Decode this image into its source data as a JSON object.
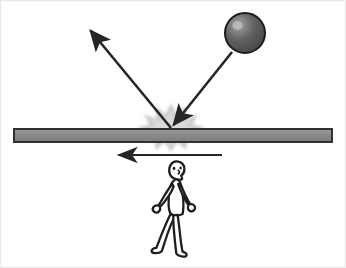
{
  "diagram": {
    "background_color": "#ffffff",
    "frame_border_color": "#e9eaec",
    "width": 346,
    "height": 268,
    "elements": {
      "ball": {
        "label": "ball",
        "shape": "circle",
        "center_x": 245,
        "center_y": 33,
        "radius": 20,
        "fill_color": "#5a5a5a",
        "highlight_color": "#9d9d9d",
        "outline_color": "#1c1c1c",
        "outline_width": 2
      },
      "incoming_arrow": {
        "label": "incoming trajectory",
        "from_x": 232,
        "from_y": 52,
        "to_x": 171,
        "to_y": 128,
        "color": "#262626",
        "stroke_width": 2.6,
        "direction": "down-left"
      },
      "outgoing_arrow": {
        "label": "rebound trajectory",
        "from_x": 171,
        "from_y": 128,
        "to_x": 88,
        "to_y": 28,
        "color": "#262626",
        "stroke_width": 2.6,
        "direction": "up-left"
      },
      "impact_burst": {
        "label": "impact starburst",
        "center_x": 171,
        "center_y": 128,
        "fill_color": "#c9c9c9",
        "points": 9,
        "outer_radius": 25,
        "inner_radius": 10
      },
      "surface_bar": {
        "label": "surface bar",
        "x": 14,
        "y": 129,
        "width": 318,
        "height": 13,
        "fill_color": "#8a8a8a",
        "outline_color": "#303030",
        "outline_width": 2
      },
      "motion_arrow": {
        "label": "surface motion direction",
        "from_x": 222,
        "from_y": 155,
        "to_x": 115,
        "to_y": 155,
        "color": "#262626",
        "stroke_width": 2.2,
        "direction": "left"
      },
      "walking_person": {
        "label": "walking person",
        "center_x": 177,
        "top_y": 162,
        "bottom_y": 253,
        "fill_color": "#ffffff",
        "outline_color": "#1e1e1e",
        "outline_width": 2.3,
        "facing": "right"
      }
    }
  }
}
